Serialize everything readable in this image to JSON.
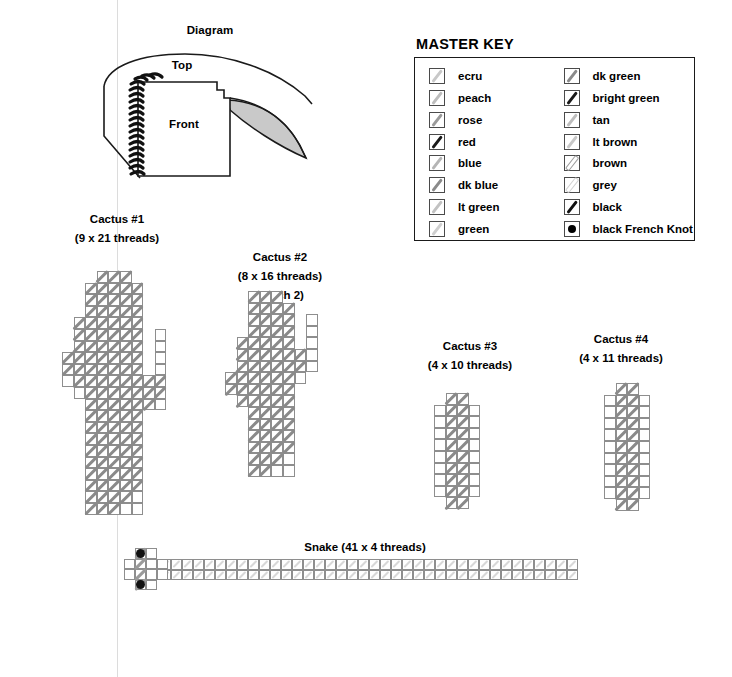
{
  "page": {
    "scan_line_x": 117
  },
  "diagram": {
    "title": "Diagram",
    "labels": {
      "top": "Top",
      "front": "Front"
    },
    "brim_fill_color": "#c9c9c9",
    "outline_color": "#1a1a1a"
  },
  "master_key": {
    "title": "MASTER KEY",
    "columns": [
      [
        {
          "label": "ecru",
          "symbol": "diagonal-stroke",
          "color": "#c8c8c8"
        },
        {
          "label": "peach",
          "symbol": "diagonal-stroke",
          "color": "#bdbdbd"
        },
        {
          "label": "rose",
          "symbol": "diagonal-stroke",
          "color": "#9a9a9a"
        },
        {
          "label": "red",
          "symbol": "diagonal-stroke",
          "color": "#1a1a1a"
        },
        {
          "label": "blue",
          "symbol": "diagonal-stroke",
          "color": "#b5b5b5"
        },
        {
          "label": "dk blue",
          "symbol": "diagonal-stroke",
          "color": "#8a8a8a"
        },
        {
          "label": "lt green",
          "symbol": "diagonal-stroke",
          "color": "#c2c2c2"
        },
        {
          "label": "green",
          "symbol": "diagonal-stroke",
          "color": "#cfcfcf"
        }
      ],
      [
        {
          "label": "dk green",
          "symbol": "diagonal-stroke",
          "color": "#8a8a8a"
        },
        {
          "label": "bright green",
          "symbol": "diagonal-stroke",
          "color": "#1a1a1a"
        },
        {
          "label": "tan",
          "symbol": "diagonal-stroke",
          "color": "#bdbdbd"
        },
        {
          "label": "lt brown",
          "symbol": "diagonal-stroke",
          "color": "#c8c8c8"
        },
        {
          "label": "brown",
          "symbol": "diagonal-outline",
          "color": "#9e9e9e"
        },
        {
          "label": "grey",
          "symbol": "diagonal-outline",
          "color": "#d2d2d2"
        },
        {
          "label": "black",
          "symbol": "diagonal-stroke",
          "color": "#111111"
        },
        {
          "label": "black French Knot",
          "symbol": "french-knot",
          "color": "#000000"
        }
      ]
    ]
  },
  "charts": [
    {
      "id": "cactus-1",
      "caption": [
        "Cactus #1",
        "(9 x 21 threads)"
      ],
      "cols": 9,
      "rows": 21,
      "grid": [
        "...XXX...",
        "..XXXXX..",
        "..XXXXX..",
        "..XXXXX..",
        ".XXXXXX..",
        ".XXXXXX.X",
        ".XXXXXX.X",
        "XXXXXXX.X",
        "XXXXXXX.X",
        "XXXXXXXXX",
        ".XXXXXXXX",
        "..XXXXXXX",
        "..XXXXX..",
        "..XXXXX..",
        "..XXXXX..",
        "..XXXXX..",
        "..XXXXX..",
        "..XXXXX..",
        "..XXXXX..",
        "..XXXXX..",
        "..XXXXX.."
      ],
      "stitched": [
        "...SSS...",
        "..SSSSS..",
        "..SSSSS..",
        "..SSSSS..",
        ".SSSSSS..",
        ".SSSSSS..",
        ".SSSSSS..",
        "SSSSSSS..",
        "SSSSSSS..",
        ".SSSSSSSS",
        "..SSSSSSS",
        "..SSSSSS.",
        "..SSSSS..",
        "..SSSSS..",
        "..SSSSS..",
        "..SSSSS..",
        "..SSSSS..",
        "..SSSSS..",
        "..SSSSS..",
        "..SSSS...",
        "..SSS...."
      ]
    },
    {
      "id": "cactus-2",
      "caption": [
        "Cactus #2",
        "(8 x 16 threads)",
        "(stitch 2)"
      ],
      "cols": 8,
      "rows": 16,
      "grid": [
        "..XXX...",
        "..XXXX..",
        "..XXXX.X",
        "..XXXX.X",
        ".XXXXX.X",
        ".XXXXXXX",
        ".XXXXXXX",
        "XXXXXXX.",
        "XXXXXX..",
        ".XXXXX..",
        "..XXXX..",
        "..XXXX..",
        "..XXXX..",
        "..XXXX..",
        "..XXXX..",
        "..XXXX.."
      ],
      "stitched": [
        "..SSS...",
        "..SSSS..",
        "..SSSS..",
        "..SSSS..",
        ".SSSSS..",
        ".SSSSSS.",
        ".SSSSSS.",
        "SSSSSS..",
        "SSSSSS..",
        ".SSSSS..",
        "..SSSS..",
        "..SSSS..",
        "..SSSS..",
        "..SSSS..",
        "..SSS...",
        "..SS...."
      ]
    },
    {
      "id": "cactus-3",
      "caption": [
        "Cactus #3",
        "(4 x 10 threads)"
      ],
      "cols": 4,
      "rows": 10,
      "grid": [
        ".XX.",
        "XXXX",
        "XXXX",
        "XXXX",
        "XXXX",
        "XXXX",
        "XXXX",
        "XXXX",
        "XXXX",
        ".XX."
      ],
      "stitched": [
        ".SS.",
        ".SS.",
        ".SS.",
        ".SS.",
        ".SS.",
        ".SS.",
        ".SS.",
        ".SS.",
        ".SS.",
        ".SS."
      ]
    },
    {
      "id": "cactus-4",
      "caption": [
        "Cactus #4",
        "(4 x 11 threads)"
      ],
      "cols": 4,
      "rows": 11,
      "grid": [
        ".XX.",
        "XXXX",
        "XXXX",
        "XXXX",
        "XXXX",
        "XXXX",
        "XXXX",
        "XXXX",
        "XXXX",
        "XXXX",
        ".XX."
      ],
      "stitched": [
        ".SS.",
        ".SS.",
        ".SS.",
        ".SS.",
        ".SS.",
        ".SS.",
        ".SS.",
        ".SS.",
        ".SS.",
        ".SS.",
        ".SS."
      ]
    }
  ],
  "snake": {
    "caption": "Snake (41 x 4 threads)",
    "cols": 41,
    "rows": 4,
    "head_cols": 3,
    "eyes": 2,
    "eye_color": "#111111"
  }
}
